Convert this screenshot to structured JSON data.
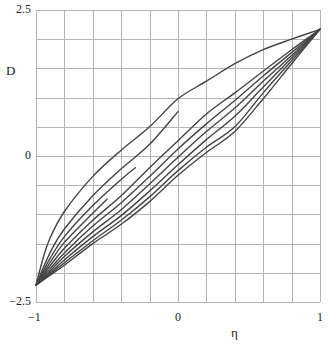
{
  "chart_data": {
    "type": "line",
    "title": "",
    "xlabel": "η",
    "ylabel": "D",
    "xlim": [
      -1,
      1
    ],
    "ylim": [
      -2.5,
      2.5
    ],
    "grid": true,
    "x_grid_step": 0.2,
    "y_grid_step": 0.5,
    "x_tick_labels": [
      {
        "value": -1,
        "label": "−1"
      },
      {
        "value": 0,
        "label": "0"
      },
      {
        "value": 1,
        "label": "1"
      }
    ],
    "y_tick_labels": [
      {
        "value": 2.5,
        "label": "2.5"
      },
      {
        "value": 0,
        "label": "0"
      },
      {
        "value": -2.5,
        "label": "−2.5"
      }
    ],
    "line_color": "#444444",
    "grid_color": "#b4b4b4",
    "series": [
      {
        "name": "curve-1",
        "points": [
          [
            -1,
            -2.21
          ],
          [
            -0.95,
            -1.75
          ],
          [
            -0.9,
            -1.4
          ],
          [
            -0.8,
            -0.95
          ],
          [
            -0.6,
            -0.35
          ],
          [
            -0.4,
            0.1
          ],
          [
            -0.2,
            0.5
          ],
          [
            0,
            0.98
          ],
          [
            0.2,
            1.28
          ],
          [
            0.4,
            1.58
          ],
          [
            0.6,
            1.82
          ],
          [
            0.8,
            2.0
          ],
          [
            1,
            2.17
          ]
        ]
      },
      {
        "name": "curve-2",
        "points": [
          [
            -1,
            -2.21
          ],
          [
            -0.9,
            -1.65
          ],
          [
            -0.8,
            -1.25
          ],
          [
            -0.6,
            -0.68
          ],
          [
            -0.4,
            -0.22
          ],
          [
            -0.2,
            0.2
          ],
          [
            0,
            0.76
          ]
        ]
      },
      {
        "name": "curve-3",
        "points": [
          [
            -1,
            -2.21
          ],
          [
            -0.9,
            -1.75
          ],
          [
            -0.8,
            -1.38
          ],
          [
            -0.6,
            -0.85
          ],
          [
            -0.4,
            -0.4
          ],
          [
            -0.3,
            -0.2
          ]
        ]
      },
      {
        "name": "curve-4",
        "points": [
          [
            -1,
            -2.21
          ],
          [
            -0.9,
            -1.82
          ],
          [
            -0.8,
            -1.48
          ],
          [
            -0.6,
            -0.98
          ],
          [
            -0.5,
            -0.74
          ]
        ]
      },
      {
        "name": "curve-5",
        "points": [
          [
            -1,
            -2.21
          ],
          [
            -0.9,
            -1.88
          ],
          [
            -0.8,
            -1.58
          ],
          [
            -0.6,
            -1.1
          ],
          [
            -0.4,
            -0.68
          ],
          [
            -0.2,
            -0.2
          ],
          [
            0,
            0.26
          ],
          [
            0.2,
            0.72
          ],
          [
            0.4,
            1.08
          ],
          [
            0.6,
            1.45
          ],
          [
            0.8,
            1.82
          ],
          [
            1,
            2.17
          ]
        ]
      },
      {
        "name": "curve-6",
        "points": [
          [
            -1,
            -2.21
          ],
          [
            -0.9,
            -1.93
          ],
          [
            -0.8,
            -1.66
          ],
          [
            -0.6,
            -1.2
          ],
          [
            -0.4,
            -0.8
          ],
          [
            -0.2,
            -0.35
          ],
          [
            0,
            0.12
          ],
          [
            0.2,
            0.55
          ],
          [
            0.4,
            0.95
          ],
          [
            0.6,
            1.37
          ],
          [
            0.8,
            1.77
          ],
          [
            1,
            2.17
          ]
        ]
      },
      {
        "name": "curve-7",
        "points": [
          [
            -1,
            -2.21
          ],
          [
            -0.9,
            -1.97
          ],
          [
            -0.8,
            -1.72
          ],
          [
            -0.6,
            -1.3
          ],
          [
            -0.4,
            -0.92
          ],
          [
            -0.2,
            -0.48
          ],
          [
            0,
            -0.02
          ],
          [
            0.2,
            0.42
          ],
          [
            0.4,
            0.82
          ],
          [
            0.6,
            1.28
          ],
          [
            0.8,
            1.72
          ],
          [
            1,
            2.17
          ]
        ]
      },
      {
        "name": "curve-8",
        "points": [
          [
            -1,
            -2.21
          ],
          [
            -0.9,
            -2.0
          ],
          [
            -0.8,
            -1.78
          ],
          [
            -0.6,
            -1.38
          ],
          [
            -0.4,
            -1.02
          ],
          [
            -0.2,
            -0.6
          ],
          [
            0,
            -0.15
          ],
          [
            0.2,
            0.28
          ],
          [
            0.4,
            0.68
          ],
          [
            0.6,
            1.18
          ],
          [
            0.8,
            1.68
          ],
          [
            1,
            2.17
          ]
        ]
      },
      {
        "name": "curve-9",
        "points": [
          [
            -1,
            -2.21
          ],
          [
            -0.9,
            -2.02
          ],
          [
            -0.8,
            -1.83
          ],
          [
            -0.6,
            -1.45
          ],
          [
            -0.4,
            -1.1
          ],
          [
            -0.2,
            -0.7
          ],
          [
            0,
            -0.25
          ],
          [
            0.2,
            0.15
          ],
          [
            0.4,
            0.5
          ],
          [
            0.6,
            1.08
          ],
          [
            0.8,
            1.63
          ],
          [
            1,
            2.17
          ]
        ]
      },
      {
        "name": "curve-10",
        "points": [
          [
            -1,
            -2.21
          ],
          [
            -0.9,
            -2.04
          ],
          [
            -0.8,
            -1.87
          ],
          [
            -0.6,
            -1.5
          ],
          [
            -0.4,
            -1.17
          ],
          [
            -0.2,
            -0.78
          ],
          [
            0,
            -0.33
          ],
          [
            0.2,
            0.06
          ],
          [
            0.4,
            0.42
          ],
          [
            0.6,
            0.98
          ],
          [
            0.8,
            1.58
          ],
          [
            1,
            2.17
          ]
        ]
      }
    ]
  }
}
